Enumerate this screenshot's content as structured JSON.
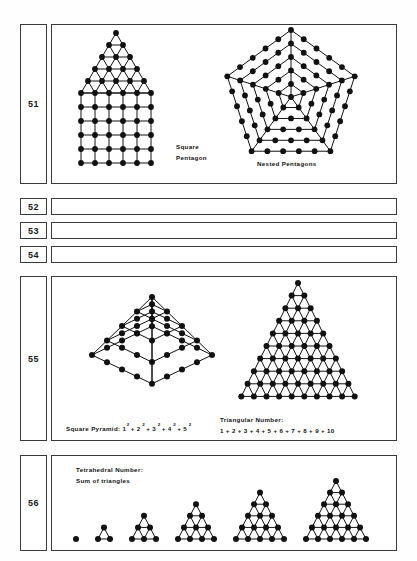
{
  "page": {
    "width": 417,
    "height": 561,
    "background": "#fefefe",
    "ink": "#111111",
    "border_color": "#3a3a3a"
  },
  "rows": [
    {
      "number": "51",
      "num_box": {
        "x": 20,
        "y": 24,
        "w": 27,
        "h": 160
      },
      "fig_box": {
        "x": 51,
        "y": 24,
        "w": 346,
        "h": 160
      },
      "figures": [
        {
          "name": "square-pentagon",
          "caption_lines": [
            "Square",
            "Pentagon"
          ],
          "type": "triangle-over-square-grid",
          "triangle_rows": 6,
          "square_rows": 6,
          "square_cols": 6
        },
        {
          "name": "nested-pentagons",
          "caption_lines": [
            "Nested  Pentagons"
          ],
          "type": "nested-pentagons",
          "rings": 5,
          "dots_per_side": [
            1,
            2,
            3,
            4,
            5
          ]
        }
      ]
    },
    {
      "number": "52",
      "num_box": {
        "x": 20,
        "y": 198,
        "w": 27,
        "h": 17
      },
      "fig_box": {
        "x": 51,
        "y": 198,
        "w": 346,
        "h": 17
      },
      "figures": []
    },
    {
      "number": "53",
      "num_box": {
        "x": 20,
        "y": 222,
        "w": 27,
        "h": 17
      },
      "fig_box": {
        "x": 51,
        "y": 222,
        "w": 346,
        "h": 17
      },
      "figures": []
    },
    {
      "number": "54",
      "num_box": {
        "x": 20,
        "y": 246,
        "w": 27,
        "h": 17
      },
      "fig_box": {
        "x": 51,
        "y": 246,
        "w": 346,
        "h": 17
      },
      "figures": []
    },
    {
      "number": "55",
      "num_box": {
        "x": 20,
        "y": 276,
        "w": 27,
        "h": 165
      },
      "fig_box": {
        "x": 51,
        "y": 276,
        "w": 346,
        "h": 165
      },
      "figures": [
        {
          "name": "square-pyramid",
          "caption_prefix": "Square Pyramid: 1",
          "caption_terms": [
            "2",
            "+ 2",
            "2",
            "+ 3",
            "2",
            "+ 4",
            "2",
            "+ 5",
            "2"
          ],
          "type": "square-pyramid-isometric",
          "levels": 5,
          "sum": "1² + 2² + 3² + 4² + 5²"
        },
        {
          "name": "triangular-number",
          "caption_lines": [
            "Triangular  Number:",
            "1 + 2 + 3 + 4 + 5 + 6 + 7 + 8 + 9 + 10"
          ],
          "type": "triangular-lattice",
          "rows": 10
        }
      ]
    },
    {
      "number": "56",
      "num_box": {
        "x": 20,
        "y": 455,
        "w": 27,
        "h": 96
      },
      "fig_box": {
        "x": 51,
        "y": 455,
        "w": 346,
        "h": 96
      },
      "figures": [
        {
          "name": "tetrahedral-number",
          "caption_lines": [
            "Tetrahedral  Number:",
            "Sum of triangles"
          ],
          "type": "triangle-series",
          "triangles": [
            1,
            2,
            3,
            4,
            5,
            6
          ]
        }
      ]
    }
  ]
}
